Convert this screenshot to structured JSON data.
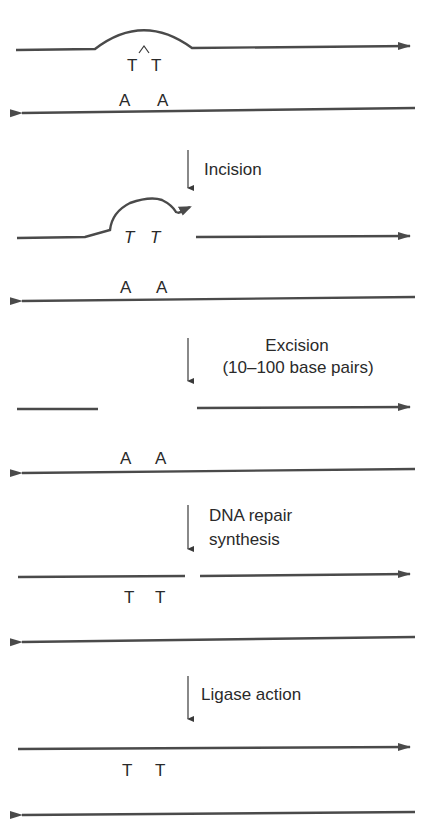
{
  "diagram": {
    "colors": {
      "strand": "#4a4a4a",
      "text": "#2a2a2a",
      "background": "#ffffff"
    },
    "stages": [
      {
        "id": "damaged",
        "top_bases": [
          "T",
          "T"
        ],
        "bottom_bases": [
          "A",
          "A"
        ],
        "dimer_mark": "^"
      },
      {
        "id": "incised",
        "top_bases": [
          "T",
          "T"
        ],
        "bottom_bases": [
          "A",
          "A"
        ]
      },
      {
        "id": "excised",
        "bottom_bases": [
          "A",
          "A"
        ]
      },
      {
        "id": "resynthesized",
        "top_bases": [
          "T",
          "T"
        ]
      },
      {
        "id": "ligated",
        "top_bases": [
          "T",
          "T"
        ]
      }
    ],
    "steps": [
      {
        "label_lines": [
          "Incision"
        ]
      },
      {
        "label_lines": [
          "Excision",
          "(10–100 base pairs)"
        ]
      },
      {
        "label_lines": [
          "DNA repair",
          "synthesis"
        ]
      },
      {
        "label_lines": [
          "Ligase action"
        ]
      }
    ]
  }
}
